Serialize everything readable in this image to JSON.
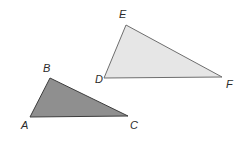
{
  "figure": {
    "name": "two-triangles-diagram",
    "background_color": "#ffffff",
    "width": 241,
    "height": 141
  },
  "style": {
    "stroke_color": "#4a4a4a",
    "stroke_width": 1,
    "label_color": "#2b2b2b"
  },
  "shapes": [
    {
      "id": "triangle-abc",
      "label": "Triangle ABC",
      "fill_color": "#8f8f8f",
      "stroke_color": "#3d3d3d",
      "points": "30,117 50,78 128,116",
      "vertices": [
        {
          "name": "A",
          "x": 30,
          "y": 117,
          "label_x": 21,
          "label_y": 120
        },
        {
          "name": "B",
          "x": 50,
          "y": 78,
          "label_x": 43,
          "label_y": 63
        },
        {
          "name": "C",
          "x": 128,
          "y": 116,
          "label_x": 130,
          "label_y": 120
        }
      ]
    },
    {
      "id": "triangle-def",
      "label": "Triangle DEF",
      "fill_color": "#e6e6e6",
      "stroke_color": "#6e6e6e",
      "points": "104,78 126,25 222,77",
      "vertices": [
        {
          "name": "D",
          "x": 104,
          "y": 78,
          "label_x": 95,
          "label_y": 74
        },
        {
          "name": "E",
          "x": 126,
          "y": 25,
          "label_x": 119,
          "label_y": 9
        },
        {
          "name": "F",
          "x": 222,
          "y": 77,
          "label_x": 226,
          "label_y": 79
        }
      ]
    }
  ]
}
